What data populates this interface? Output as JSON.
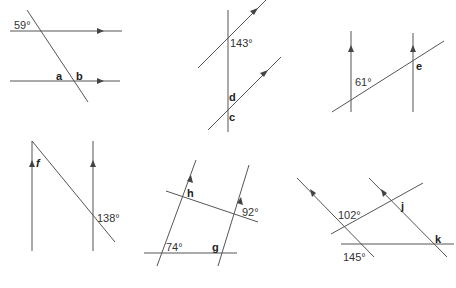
{
  "diagrams": [
    {
      "id": "d1",
      "labels": {
        "angle": "59°",
        "a": "a",
        "b": "b"
      }
    },
    {
      "id": "d2",
      "labels": {
        "angle": "143°",
        "d": "d",
        "c": "c"
      }
    },
    {
      "id": "d3",
      "labels": {
        "angle": "61°",
        "e": "e"
      }
    },
    {
      "id": "d4",
      "labels": {
        "f": "f",
        "angle": "138°"
      }
    },
    {
      "id": "d5",
      "labels": {
        "h": "h",
        "angle_right": "92°",
        "angle_left": "74°",
        "g": "g"
      }
    },
    {
      "id": "d6",
      "labels": {
        "angle_top": "102°",
        "j": "j",
        "k": "k",
        "angle_bottom": "145°"
      }
    }
  ],
  "colors": {
    "line": "#555555",
    "text": "#333333",
    "background": "#ffffff"
  }
}
